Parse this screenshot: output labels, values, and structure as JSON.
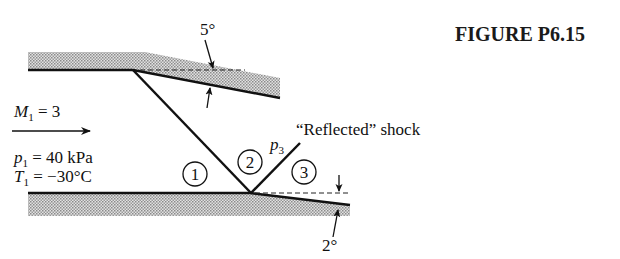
{
  "figure": {
    "title": "FIGURE P6.15"
  },
  "flow": {
    "mach_label": "M",
    "mach_sub": "1",
    "mach_value": " = 3",
    "pressure_label": "p",
    "pressure_sub": "1",
    "pressure_value": " = 40 kPa",
    "temp_label": "T",
    "temp_sub": "1",
    "temp_value": " = −30°C"
  },
  "angles": {
    "upper_wall": "5°",
    "lower_wall": "2°"
  },
  "regions": [
    "1",
    "2",
    "3"
  ],
  "p3": {
    "label": "p",
    "sub": "3"
  },
  "reflected_shock_label": "“Reflected” shock",
  "colors": {
    "line": "#111111",
    "shade": "#b8b8b8"
  }
}
